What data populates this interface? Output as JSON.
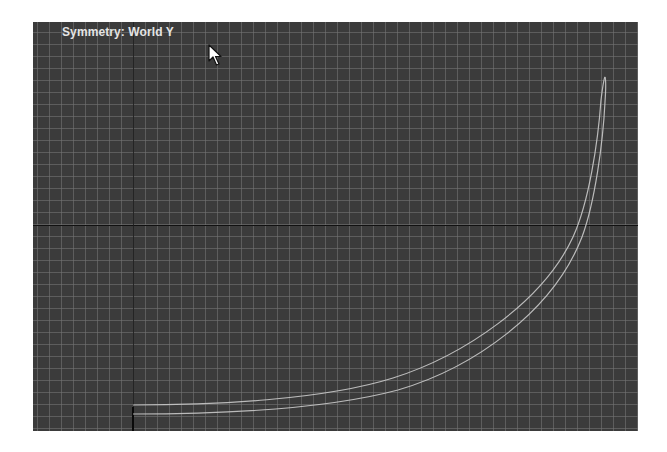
{
  "viewport": {
    "overlay_label": "Symmetry: World Y",
    "background_color": "#3b3b3b",
    "grid_color": "#5c5c5c",
    "axis_color": "#111111",
    "curve_color": "#c8c8c8"
  },
  "cursor": {
    "icon": "arrow-pointer-icon"
  }
}
